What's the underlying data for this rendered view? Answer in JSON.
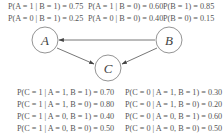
{
  "diagram": {
    "type": "bayesian-network",
    "nodes": [
      {
        "id": "A",
        "label": "A"
      },
      {
        "id": "B",
        "label": "B"
      },
      {
        "id": "C",
        "label": "C"
      }
    ],
    "edges": [
      {
        "from": "B",
        "to": "A"
      },
      {
        "from": "A",
        "to": "C"
      },
      {
        "from": "B",
        "to": "C"
      }
    ],
    "colors": {
      "stroke": "#666666",
      "text": "#555555",
      "background": "#ffffff"
    }
  },
  "top_probs": {
    "row1": [
      "P(A = 1 | B = 1) = 0.75",
      "P(A = 1 | B = 0) = 0.60",
      "P(B = 1) = 0.85"
    ],
    "row2": [
      "P(A = 0 | B = 1) = 0.25",
      "P(A = 0 | B = 0) = 0.40",
      "P(B = 0) = 0.15"
    ]
  },
  "c_probs": {
    "left": [
      "P(C = 1 | A = 1, B = 1) = 0.70",
      "P(C = 1 | A = 1, B = 0) = 0.80",
      "P(C = 1 | A = 0, B = 1) = 0.40",
      "P(C = 1 | A = 0, B = 0) = 0.50"
    ],
    "right": [
      "P(C = 0 | A = 1, B = 1) = 0.30",
      "P(C = 0 | A = 1, B = 0) = 0.20",
      "P(C = 0 | A = 0, B = 1) = 0.60",
      "P(C = 0 | A = 0, B = 0) = 0.50"
    ]
  }
}
